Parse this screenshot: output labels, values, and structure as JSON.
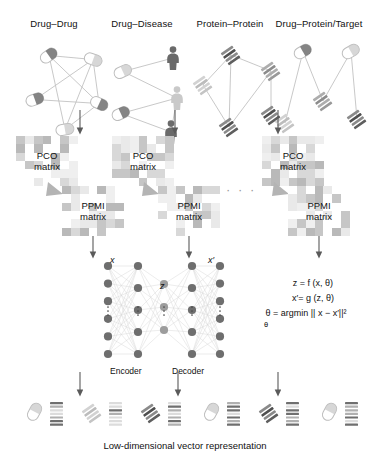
{
  "figure": {
    "caption": "Low-dimensional vector representation",
    "ellipsis": "· · ·"
  },
  "networks": [
    {
      "id": "drug-drug",
      "label": "Drug–Drug",
      "nodes": [
        {
          "type": "pill",
          "x": 30,
          "y": 18,
          "rot": -35,
          "shade": "dark"
        },
        {
          "type": "pill",
          "x": 74,
          "y": 22,
          "rot": 20,
          "shade": "light"
        },
        {
          "type": "pill",
          "x": 16,
          "y": 62,
          "rot": -20,
          "shade": "dark"
        },
        {
          "type": "pill",
          "x": 80,
          "y": 66,
          "rot": 25,
          "shade": "dark"
        },
        {
          "type": "pill",
          "x": 46,
          "y": 92,
          "rot": -10,
          "shade": "light"
        }
      ],
      "edges": [
        [
          0,
          1
        ],
        [
          0,
          3
        ],
        [
          0,
          4
        ],
        [
          1,
          2
        ],
        [
          1,
          4
        ],
        [
          2,
          3
        ],
        [
          3,
          4
        ],
        [
          1,
          3
        ]
      ]
    },
    {
      "id": "drug-disease",
      "label": "Drug–Disease",
      "nodes": [
        {
          "type": "pill",
          "x": 14,
          "y": 34,
          "rot": -25,
          "shade": "light"
        },
        {
          "type": "person",
          "x": 66,
          "y": 14,
          "shade": "dark"
        },
        {
          "type": "person",
          "x": 70,
          "y": 54,
          "shade": "light"
        },
        {
          "type": "pill",
          "x": 12,
          "y": 76,
          "rot": -25,
          "shade": "dark"
        },
        {
          "type": "person",
          "x": 64,
          "y": 88,
          "shade": "dark"
        }
      ],
      "edges": [
        [
          0,
          1
        ],
        [
          0,
          2
        ],
        [
          3,
          2
        ],
        [
          3,
          4
        ],
        [
          2,
          4
        ]
      ]
    },
    {
      "id": "protein-protein",
      "label": "Protein–Protein",
      "nodes": [
        {
          "type": "protein",
          "x": 36,
          "y": 16,
          "rot": -35,
          "shade": "dark"
        },
        {
          "type": "protein",
          "x": 76,
          "y": 32,
          "rot": -35,
          "shade": "mid"
        },
        {
          "type": "protein",
          "x": 8,
          "y": 46,
          "rot": -35,
          "shade": "light"
        },
        {
          "type": "protein",
          "x": 34,
          "y": 88,
          "rot": -35,
          "shade": "dark"
        },
        {
          "type": "protein",
          "x": 76,
          "y": 76,
          "rot": -35,
          "shade": "dark"
        }
      ],
      "edges": [
        [
          0,
          1
        ],
        [
          0,
          2
        ],
        [
          0,
          3
        ],
        [
          1,
          3
        ],
        [
          2,
          3
        ],
        [
          1,
          4
        ]
      ]
    },
    {
      "id": "drug-protein-target",
      "label": "Drug–Protein/Target",
      "nodes": [
        {
          "type": "pill",
          "x": 20,
          "y": 14,
          "rot": -30,
          "shade": "dark"
        },
        {
          "type": "pill",
          "x": 68,
          "y": 14,
          "rot": -30,
          "shade": "light"
        },
        {
          "type": "protein",
          "x": 42,
          "y": 62,
          "rot": -35,
          "shade": "mid"
        },
        {
          "type": "protein",
          "x": 4,
          "y": 84,
          "rot": -35,
          "shade": "light"
        },
        {
          "type": "protein",
          "x": 76,
          "y": 80,
          "rot": -35,
          "shade": "dark"
        }
      ],
      "edges": [
        [
          0,
          3
        ],
        [
          0,
          2
        ],
        [
          1,
          2
        ],
        [
          1,
          4
        ]
      ]
    }
  ],
  "matrices": {
    "pco_label_line1": "PCO",
    "pco_label_line2": "matrix",
    "ppmi_label_line1": "PPMI",
    "ppmi_label_line2": "matrix",
    "pco_positions": [
      {
        "x": 16,
        "y": 136
      },
      {
        "x": 112,
        "y": 136
      },
      {
        "x": 262,
        "y": 136
      }
    ],
    "ppmi_positions": [
      {
        "x": 62,
        "y": 186
      },
      {
        "x": 158,
        "y": 186
      },
      {
        "x": 288,
        "y": 186
      }
    ]
  },
  "autoencoder": {
    "input_label": "x",
    "latent_label": "z",
    "output_label": "x′",
    "encoder_label": "Encoder",
    "decoder_label": "Decoder",
    "layers": [
      {
        "name": "input",
        "count": 6,
        "shade": "dark"
      },
      {
        "name": "hidden1",
        "count": 5,
        "shade": "dark"
      },
      {
        "name": "latent",
        "count": 3,
        "shade": "mid"
      },
      {
        "name": "hidden2",
        "count": 5,
        "shade": "dark"
      },
      {
        "name": "output",
        "count": 6,
        "shade": "dark"
      }
    ],
    "equations": [
      "z = f (x, θ)",
      "x′= g (z, θ)",
      "θ = argmin || x − x′||²",
      "θ"
    ]
  },
  "output_row": [
    {
      "icon": "pill",
      "shade": "light"
    },
    {
      "icon": "protein",
      "shade": "light"
    },
    {
      "icon": "protein",
      "shade": "dark"
    },
    {
      "icon": "pill",
      "shade": "light"
    },
    {
      "icon": "protein",
      "shade": "dark"
    },
    {
      "icon": "pill",
      "shade": "light"
    }
  ],
  "colors": {
    "dark": "#6e6e6e",
    "mid": "#9c9c9c",
    "light": "#c9c9c9",
    "edge": "#c2c2c2",
    "arrow": "#5a5a5a",
    "text": "#111111"
  }
}
